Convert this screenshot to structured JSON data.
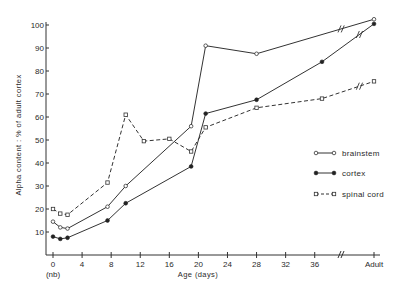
{
  "chart_data": {
    "type": "line",
    "title": "",
    "xlabel": "Age (days)",
    "ylabel": "Alpha content :  % of adult cortex",
    "xlim": [
      0,
      44
    ],
    "ylim": [
      0,
      100
    ],
    "grid": false,
    "legend_position": "right-middle",
    "x_ticks": [
      0,
      4,
      8,
      12,
      16,
      20,
      24,
      28,
      32,
      36
    ],
    "x_tick_labels": [
      "0",
      "4",
      "8",
      "12",
      "16",
      "20",
      "24",
      "28",
      "32",
      "36"
    ],
    "x_extra_label": "Adult",
    "x_extra_sublabel_under_0": "(nb)",
    "x_axis_break": "between 36 and Adult",
    "y_ticks": [
      10,
      20,
      30,
      40,
      50,
      60,
      70,
      80,
      90,
      100
    ],
    "y_tick_labels": [
      "10",
      "20",
      "30",
      "40",
      "50",
      "60",
      "70",
      "80",
      "90",
      "100"
    ],
    "series": [
      {
        "name": "brainstem",
        "style": "solid",
        "marker": "open-circle",
        "x": [
          0,
          1,
          2,
          7.5,
          10,
          19,
          21,
          28,
          "Adult"
        ],
        "values": [
          14.5,
          12,
          11.5,
          21,
          30,
          56,
          91,
          87.5,
          102.5
        ]
      },
      {
        "name": "cortex",
        "style": "solid",
        "marker": "filled-circle",
        "x": [
          0,
          1,
          2,
          7.5,
          10,
          19,
          21,
          28,
          37,
          "Adult"
        ],
        "values": [
          8,
          7,
          7.5,
          15,
          22.5,
          38.5,
          61.5,
          67.5,
          84,
          100.5
        ]
      },
      {
        "name": "spinal cord",
        "style": "dashed",
        "marker": "open-square",
        "x": [
          0,
          1,
          2,
          7.5,
          10,
          12.5,
          16,
          19,
          21,
          28,
          37,
          "Adult"
        ],
        "values": [
          20,
          18,
          17.5,
          31.5,
          61,
          49.5,
          50.5,
          45,
          55.5,
          64,
          68,
          75.5
        ]
      }
    ]
  },
  "legend": {
    "items": [
      {
        "label": "brainstem"
      },
      {
        "label": "cortex"
      },
      {
        "label": "spinal cord"
      }
    ]
  },
  "axes": {
    "x_title": "Age (days)",
    "y_title": "Alpha content :  % of adult cortex",
    "nb_label": "(nb)",
    "adult_label": "Adult"
  }
}
